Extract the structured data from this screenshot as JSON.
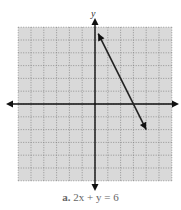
{
  "chart_data": {
    "type": "line",
    "title": "",
    "caption_label": "a.",
    "caption_equation": "2x + y = 6",
    "xlabel": "",
    "ylabel": "y",
    "xlim": [
      -6,
      6
    ],
    "ylim": [
      -6,
      6
    ],
    "grid": true,
    "grid_step": 1,
    "background": "#d9d9d9",
    "series": [
      {
        "name": "2x + y = 6",
        "x": [
          0.25,
          4.0
        ],
        "y": [
          5.5,
          -2.0
        ],
        "arrows": "both",
        "color": "#222222"
      }
    ]
  }
}
